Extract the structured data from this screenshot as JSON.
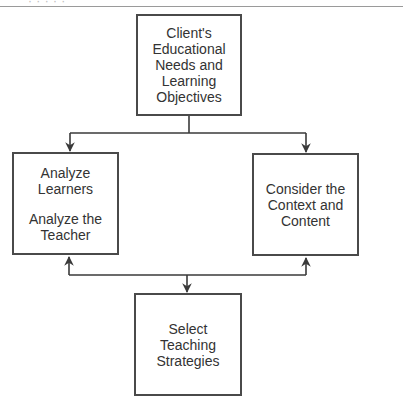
{
  "page": {
    "header_fragment": "· · ·   · ·"
  },
  "diagram": {
    "nodes": {
      "top": {
        "lines": [
          "Client's",
          "Educational",
          "Needs and",
          "Learning",
          "Objectives"
        ]
      },
      "left": {
        "group1": [
          "Analyze",
          "Learners"
        ],
        "group2": [
          "Analyze the",
          "Teacher"
        ]
      },
      "right": {
        "lines": [
          "Consider the",
          "Context and",
          "Content"
        ]
      },
      "bottom": {
        "lines": [
          "Select",
          "Teaching",
          "Strategies"
        ]
      }
    },
    "edges": [
      {
        "from": "top",
        "to": "left",
        "arrow": "to"
      },
      {
        "from": "top",
        "to": "right",
        "arrow": "to"
      },
      {
        "from": "bottom-junction",
        "to": "left",
        "arrow": "to"
      },
      {
        "from": "bottom-junction",
        "to": "right",
        "arrow": "to"
      },
      {
        "from": "bottom-junction",
        "to": "bottom",
        "arrow": "to"
      }
    ],
    "colors": {
      "line": "#3a3a3a",
      "box_border": "#4a4a4a",
      "text": "#333333",
      "rule": "#9a9a9a"
    }
  }
}
